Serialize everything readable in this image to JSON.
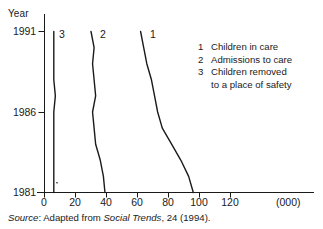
{
  "axes": {
    "y_title": "Year",
    "y_ticks": [
      "1991",
      "1986",
      "1981"
    ],
    "x_ticks": [
      "0",
      "20",
      "40",
      "60",
      "80",
      "100",
      "120"
    ],
    "x_units": "(000)"
  },
  "curve_tags": {
    "one": "1",
    "two": "2",
    "three": "3"
  },
  "legend": {
    "items": [
      {
        "key": "1",
        "label": "Children in care"
      },
      {
        "key": "2",
        "label": "Admissions to care"
      },
      {
        "key": "3",
        "label": "Children removed"
      }
    ],
    "continuation": "to a place of safety"
  },
  "source": {
    "prefix": "Source",
    "mid": ": Adapted from ",
    "publication": "Social Trends",
    "suffix": ", 24 (1994)."
  },
  "colors": {
    "line": "#1a1a1a",
    "axis": "#1a1a1a",
    "background": "#ffffff"
  },
  "chart_data": {
    "type": "line",
    "title": "",
    "subtitle": "",
    "xlabel": "(000)",
    "ylabel": "Year",
    "orientation": "horizontal",
    "grid": false,
    "legend_position": "right",
    "xlim": [
      0,
      140
    ],
    "ylim": [
      1981,
      1991
    ],
    "x_ticks": [
      0,
      20,
      40,
      60,
      80,
      100,
      120
    ],
    "y_ticks": [
      1981,
      1986,
      1991
    ],
    "x": [
      1981,
      1982,
      1983,
      1984,
      1985,
      1986,
      1987,
      1988,
      1989,
      1990,
      1991
    ],
    "series": [
      {
        "name": "Children in care",
        "key": "1",
        "values": [
          96,
          93,
          88,
          82,
          76,
          73,
          71,
          69,
          66,
          64,
          62
        ]
      },
      {
        "name": "Admissions to care",
        "key": "2",
        "values": [
          39,
          38,
          36,
          33,
          32,
          31,
          33,
          32,
          31,
          32,
          30
        ]
      },
      {
        "name": "Children removed to a place of safety",
        "key": "3",
        "values": [
          6,
          6,
          6,
          6,
          6,
          6,
          7,
          6,
          6,
          6,
          6
        ]
      }
    ],
    "annotations": [
      "1",
      "2",
      "3"
    ]
  }
}
